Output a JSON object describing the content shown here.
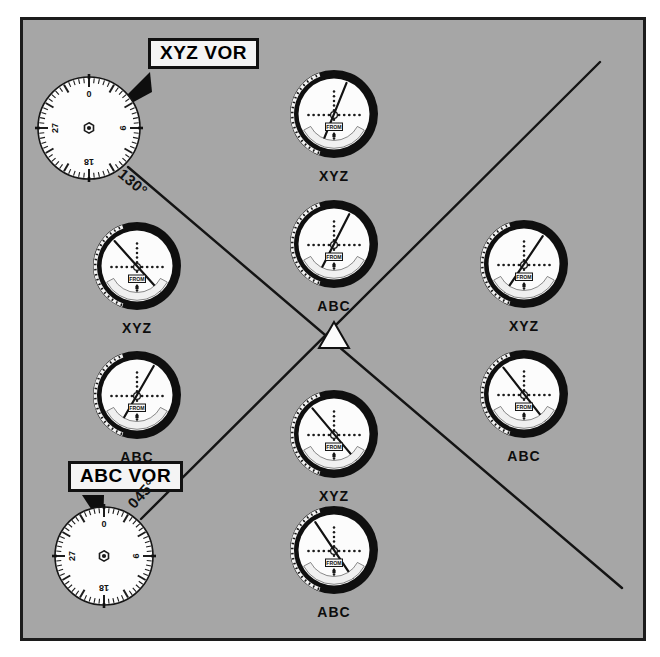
{
  "figure": {
    "background_color": "#a6a6a6",
    "frame_color": "#1c1c1c",
    "page_color": "#ffffff"
  },
  "callouts": [
    {
      "id": "xyz",
      "label": "XYZ VOR",
      "x": 148,
      "y": 38
    },
    {
      "id": "abc",
      "label": "ABC VOR",
      "x": 68,
      "y": 461
    }
  ],
  "stations": [
    {
      "id": "xyz-station",
      "name": "XYZ VOR",
      "cx": 89,
      "cy": 128,
      "r": 51,
      "compass_ticks": [
        "0",
        "9",
        "18",
        "27"
      ]
    },
    {
      "id": "abc-station",
      "name": "ABC VOR",
      "cx": 104,
      "cy": 556,
      "r": 49,
      "compass_ticks": [
        "0",
        "9",
        "18",
        "27"
      ]
    }
  ],
  "radials": [
    {
      "id": "radial-130",
      "label": "130°",
      "from_station": "XYZ VOR",
      "bearing_deg": 130,
      "label_x": 126,
      "label_y": 170,
      "label_rotation_deg": 40,
      "x1": 128,
      "y1": 167,
      "x2": 622,
      "y2": 588
    },
    {
      "id": "radial-045",
      "label": "045°",
      "from_station": "ABC VOR",
      "bearing_deg": 45,
      "label_x": 128,
      "label_y": 481,
      "label_rotation_deg": -47,
      "x1": 141,
      "y1": 519,
      "x2": 600,
      "y2": 62
    }
  ],
  "intersection": {
    "id": "position-fix",
    "symbol": "triangle",
    "cx": 334,
    "cy": 335,
    "fill": "#fbfbfb",
    "stroke": "#111111"
  },
  "indicators": [
    {
      "id": "ind-top-xyz",
      "label": "XYZ",
      "cx": 334,
      "cy": 114,
      "r": 44,
      "needle_angle_deg": 22,
      "cdi_deflection": "right",
      "flag": "FROM",
      "label_x": 289,
      "label_y": 168
    },
    {
      "id": "ind-upper-mid-abc",
      "label": "ABC",
      "cx": 334,
      "cy": 244,
      "r": 44,
      "needle_angle_deg": 27,
      "cdi_deflection": "right",
      "flag": "FROM",
      "label_x": 289,
      "label_y": 298
    },
    {
      "id": "ind-left-xyz",
      "label": "XYZ",
      "cx": 137,
      "cy": 266,
      "r": 44,
      "needle_angle_deg": -42,
      "cdi_deflection": "left",
      "flag": "FROM",
      "label_x": 92,
      "label_y": 320
    },
    {
      "id": "ind-left-abc",
      "label": "ABC",
      "cx": 137,
      "cy": 395,
      "r": 44,
      "needle_angle_deg": 30,
      "cdi_deflection": "right",
      "flag": "FROM",
      "label_x": 92,
      "label_y": 449
    },
    {
      "id": "ind-right-xyz",
      "label": "XYZ",
      "cx": 524,
      "cy": 264,
      "r": 44,
      "needle_angle_deg": 34,
      "cdi_deflection": "right",
      "flag": "FROM",
      "label_x": 479,
      "label_y": 318
    },
    {
      "id": "ind-right-abc",
      "label": "ABC",
      "cx": 524,
      "cy": 394,
      "r": 44,
      "needle_angle_deg": -38,
      "cdi_deflection": "left",
      "flag": "FROM",
      "label_x": 479,
      "label_y": 448
    },
    {
      "id": "ind-lower-mid-xyz",
      "label": "XYZ",
      "cx": 334,
      "cy": 434,
      "r": 44,
      "needle_angle_deg": -40,
      "cdi_deflection": "left",
      "flag": "FROM",
      "label_x": 289,
      "label_y": 488
    },
    {
      "id": "ind-bottom-abc",
      "label": "ABC",
      "cx": 334,
      "cy": 550,
      "r": 44,
      "needle_angle_deg": -34,
      "cdi_deflection": "left",
      "flag": "FROM",
      "label_x": 289,
      "label_y": 604
    }
  ],
  "indicator_flag_text": "FROM",
  "colors": {
    "instrument_bezel": "#111111",
    "instrument_face": "#fcfcfc",
    "needle": "#1a1a1a",
    "dot": "#1a1a1a"
  }
}
